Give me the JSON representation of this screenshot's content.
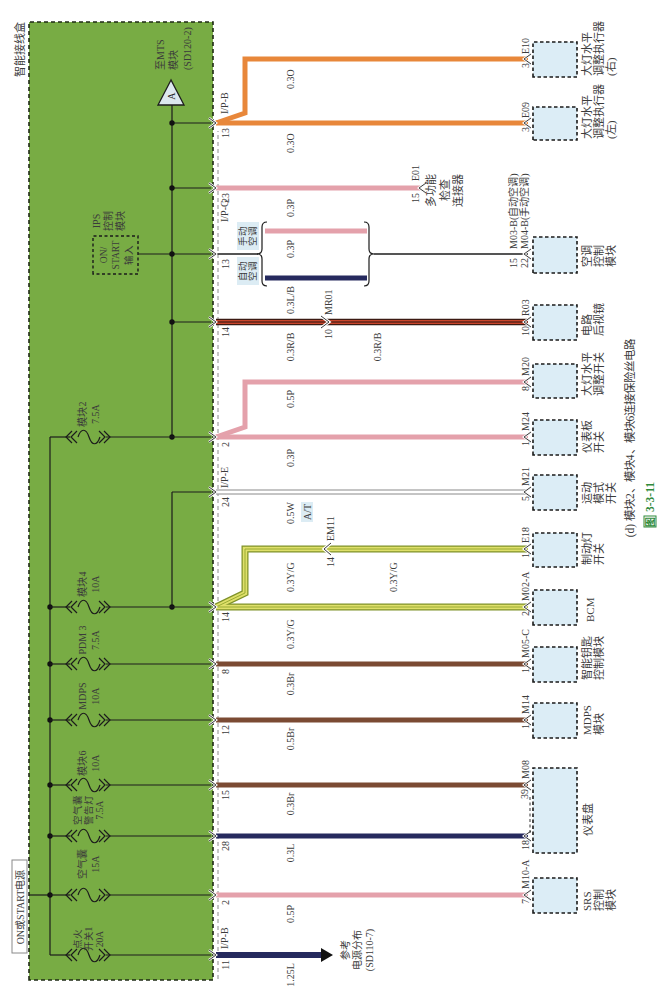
{
  "diagram": {
    "box_title": "智能接线盒",
    "power_source": "ON或START电源",
    "mts_marker": "A",
    "mts_ref": [
      "至MTS",
      "模块",
      "(SD120-2)"
    ],
    "ips_title": [
      "IPS",
      "控制",
      "模块"
    ],
    "ips_input": [
      "ON/",
      "START",
      "输入"
    ],
    "ac_manual": [
      "手动",
      "空调"
    ],
    "ac_auto": [
      "自动",
      "空调"
    ],
    "power_ref": [
      "参考",
      "电源分布",
      "(SD110-7)"
    ]
  },
  "fuses": [
    {
      "name": "模块2",
      "rating": "7.5A"
    },
    {
      "name": "模块4",
      "rating": "10A"
    },
    {
      "name": "PDM 3",
      "rating": "7.5A"
    },
    {
      "name": "MDPS",
      "rating": "10A"
    },
    {
      "name": "模块6",
      "rating": "10A"
    },
    {
      "name": "空气囊",
      "name2": "警告灯",
      "rating": "7.5A"
    },
    {
      "name": "空气囊",
      "rating": "15A"
    },
    {
      "name": "点火",
      "name2": "开关1",
      "rating": "20A"
    }
  ],
  "pins": [
    {
      "connector": "I/P-B",
      "number": "13"
    },
    {
      "number": "23"
    },
    {
      "connector": "I/P-G",
      "number": "13"
    },
    {
      "number": "14"
    },
    {
      "number": "2"
    },
    {
      "connector": "I/P-E",
      "number": "24"
    },
    {
      "number": "14"
    },
    {
      "number": "8"
    },
    {
      "number": "12"
    },
    {
      "number": "15"
    },
    {
      "number": "28"
    },
    {
      "number": "2"
    },
    {
      "connector": "I/P-B",
      "number": "11"
    }
  ],
  "wire_labels": [
    "0.3O",
    "0.3O",
    "0.3P",
    "0.3P",
    "0.3L/B",
    "0.3R/B",
    "0.3R/B",
    "0.5P",
    "0.3P",
    "0.5W",
    "A/T",
    "0.3Y/G",
    "0.3Y/G",
    "0.3Y/G",
    "0.3Br",
    "0.5Br",
    "0.3Br",
    "0.3L",
    "0.5P",
    "1.25L"
  ],
  "inline_connectors": [
    {
      "name": "MR01",
      "pin": "10"
    },
    {
      "name": "EM11",
      "pin": "14"
    }
  ],
  "components": [
    {
      "connector": "E10",
      "pin": "3",
      "label": [
        "大灯水平",
        "调整执行器",
        "(右)"
      ]
    },
    {
      "connector": "E09",
      "pin": "3",
      "label": [
        "大灯水平",
        "调整执行器",
        "(左)"
      ]
    },
    {
      "connector": "E01",
      "pin": "15",
      "label": [
        "多功能",
        "检查",
        "连接器"
      ]
    },
    {
      "connector": "M03-B(自动空调)",
      "pin": "15",
      "connector2": "M04-B(手动空调)",
      "pin2": "22",
      "label": [
        "空调",
        "控制",
        "模块"
      ]
    },
    {
      "connector": "R03",
      "pin": "10",
      "label": [
        "电路",
        "后视镜"
      ]
    },
    {
      "connector": "M20",
      "pin": "8",
      "label": [
        "大灯水平",
        "调整开关"
      ]
    },
    {
      "connector": "M24",
      "pin": "1",
      "label": [
        "仪表板",
        "开关"
      ]
    },
    {
      "connector": "M21",
      "pin": "5",
      "label": [
        "运动",
        "模式",
        "开关"
      ]
    },
    {
      "connector": "E18",
      "pin": "1",
      "label": [
        "制动灯",
        "开关"
      ]
    },
    {
      "connector": "M02-A",
      "pin": "2",
      "label": [
        "BCM"
      ]
    },
    {
      "connector": "M05-C",
      "pin": "1",
      "label": [
        "智能钥匙",
        "控制模块"
      ]
    },
    {
      "connector": "M14",
      "pin": "1",
      "label": [
        "MDPS",
        "模块"
      ]
    },
    {
      "connector": "M08",
      "pin": "39",
      "pin2": "18",
      "label": [
        "仪表盘"
      ]
    },
    {
      "connector": "M10-A",
      "pin": "7",
      "label": [
        "SRS",
        "控制",
        "模块"
      ]
    }
  ],
  "caption": "(d) 模块2、模块4、模块6连接保险丝电路",
  "figure": {
    "prefix": "图",
    "number": "3-3-11"
  },
  "colors": {
    "junction_box": "#78ac44",
    "orange": "#e8873a",
    "pink": "#e4a1ab",
    "navy": "#262a5e",
    "red": "#c9452b",
    "yellow_green": "#dfe06a",
    "olive": "#7f922a",
    "brown": "#7b4a33",
    "component_fill": "#dcedf6",
    "caption_green": "#2f8a3a"
  }
}
